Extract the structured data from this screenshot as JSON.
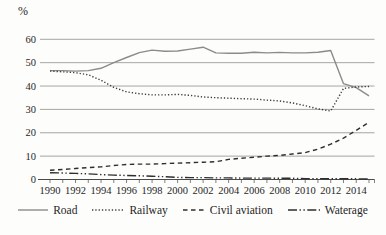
{
  "colors": {
    "grid": "#8f8f8f",
    "axis": "#4a4a4a",
    "text": "#1f1f1f",
    "road_line": "#8b8b8b",
    "railway_line": "#3d3d3d",
    "civil_aviation_line": "#2e2e2e",
    "waterage_line": "#2e2e2e"
  },
  "chart_data": {
    "type": "line",
    "title": "",
    "xlabel": "",
    "ylabel": "%",
    "ylim": [
      0,
      60
    ],
    "grid": "horizontal",
    "legend_position": "bottom",
    "y_ticks": [
      0,
      10,
      20,
      30,
      40,
      50,
      60
    ],
    "x_tick_labels": [
      "1990",
      "1992",
      "1994",
      "1996",
      "1998",
      "2000",
      "2002",
      "2004",
      "2006",
      "2008",
      "2010",
      "2012",
      "2014"
    ],
    "x": [
      1990,
      1991,
      1992,
      1993,
      1994,
      1995,
      1996,
      1997,
      1998,
      1999,
      2000,
      2001,
      2002,
      2003,
      2004,
      2005,
      2006,
      2007,
      2008,
      2009,
      2010,
      2011,
      2012,
      2013,
      2014,
      2015
    ],
    "series": [
      {
        "name": "Road",
        "style": "solid",
        "color": "#8b8b8b",
        "values": [
          46.6,
          46.6,
          46.4,
          46.6,
          47.6,
          50.0,
          52.2,
          54.3,
          55.4,
          54.9,
          55.0,
          55.8,
          56.6,
          54.2,
          54.0,
          54.0,
          54.5,
          54.2,
          54.4,
          54.2,
          54.2,
          54.5,
          55.2,
          41.0,
          39.3,
          35.8
        ]
      },
      {
        "name": "Railway",
        "style": "dotted",
        "color": "#3d3d3d",
        "values": [
          46.4,
          46.1,
          45.7,
          44.8,
          42.5,
          39.4,
          37.5,
          36.7,
          36.2,
          36.2,
          36.4,
          36.0,
          35.3,
          35.0,
          34.8,
          34.6,
          34.4,
          34.0,
          33.6,
          32.8,
          31.6,
          30.2,
          29.3,
          39.0,
          39.6,
          39.8
        ]
      },
      {
        "name": "Civil aviation",
        "style": "dashed",
        "color": "#2e2e2e",
        "values": [
          4.0,
          4.3,
          4.7,
          5.1,
          5.4,
          6.0,
          6.4,
          6.6,
          6.6,
          6.8,
          7.0,
          7.2,
          7.4,
          7.6,
          8.6,
          9.1,
          9.5,
          10.0,
          10.3,
          10.9,
          11.5,
          13.0,
          15.1,
          17.7,
          21.0,
          24.5
        ]
      },
      {
        "name": "Waterage",
        "style": "dash-dot-dot",
        "color": "#2e2e2e",
        "values": [
          2.9,
          2.8,
          2.6,
          2.4,
          2.1,
          1.9,
          1.7,
          1.6,
          1.4,
          1.2,
          0.9,
          0.8,
          0.8,
          0.7,
          0.7,
          0.6,
          0.6,
          0.6,
          0.5,
          0.5,
          0.4,
          0.4,
          0.3,
          0.3,
          0.3,
          0.2
        ]
      }
    ]
  }
}
